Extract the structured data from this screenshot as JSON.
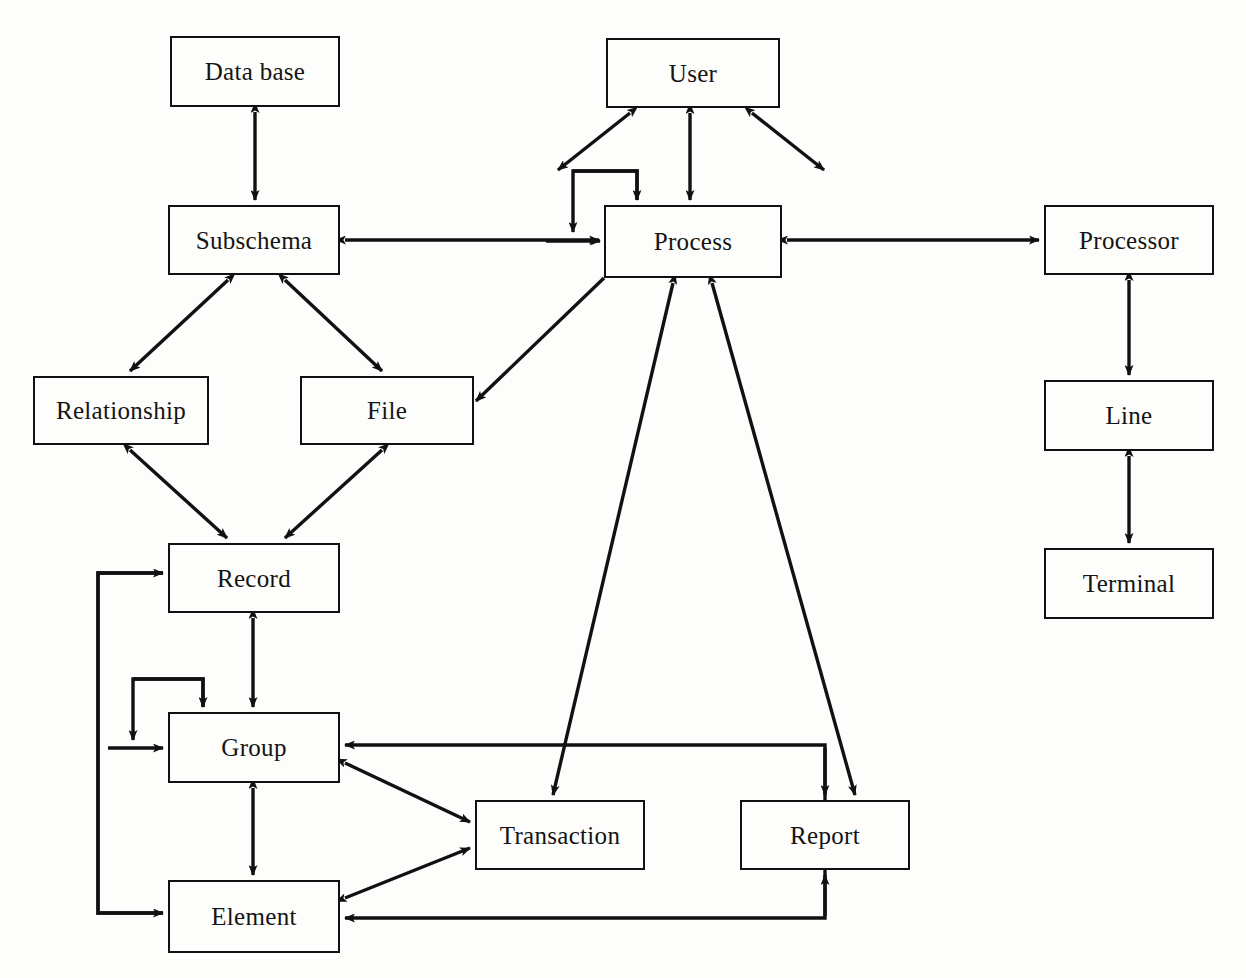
{
  "diagram": {
    "background_color": "#fdfdfc",
    "line_color": "#111111",
    "box_border_color": "#111111",
    "nodes": [
      {
        "id": "database",
        "label": "Data base",
        "x": 170,
        "y": 36,
        "w": 170,
        "h": 71
      },
      {
        "id": "user",
        "label": "User",
        "x": 606,
        "y": 38,
        "w": 174,
        "h": 70
      },
      {
        "id": "subschema",
        "label": "Subschema",
        "x": 168,
        "y": 205,
        "w": 172,
        "h": 70
      },
      {
        "id": "process",
        "label": "Process",
        "x": 604,
        "y": 205,
        "w": 178,
        "h": 73
      },
      {
        "id": "processor",
        "label": "Processor",
        "x": 1044,
        "y": 205,
        "w": 170,
        "h": 70
      },
      {
        "id": "relationship",
        "label": "Relationship",
        "x": 33,
        "y": 376,
        "w": 176,
        "h": 69
      },
      {
        "id": "file",
        "label": "File",
        "x": 300,
        "y": 376,
        "w": 174,
        "h": 69
      },
      {
        "id": "line",
        "label": "Line",
        "x": 1044,
        "y": 380,
        "w": 170,
        "h": 71
      },
      {
        "id": "record",
        "label": "Record",
        "x": 168,
        "y": 543,
        "w": 172,
        "h": 70
      },
      {
        "id": "terminal",
        "label": "Terminal",
        "x": 1044,
        "y": 548,
        "w": 170,
        "h": 71
      },
      {
        "id": "group",
        "label": "Group",
        "x": 168,
        "y": 712,
        "w": 172,
        "h": 71
      },
      {
        "id": "transaction",
        "label": "Transaction",
        "x": 475,
        "y": 800,
        "w": 170,
        "h": 70
      },
      {
        "id": "report",
        "label": "Report",
        "x": 740,
        "y": 800,
        "w": 170,
        "h": 70
      },
      {
        "id": "element",
        "label": "Element",
        "x": 168,
        "y": 880,
        "w": 172,
        "h": 73
      }
    ],
    "edges": [
      {
        "id": "database-subschema",
        "from": "database",
        "to": "subschema",
        "style": "vertical",
        "arrows": "both"
      },
      {
        "id": "user-process",
        "from": "user",
        "to": "process",
        "style": "vertical",
        "arrows": "both"
      },
      {
        "id": "user-left-stub",
        "from": "user",
        "to": "",
        "style": "diagonal",
        "arrows": "both"
      },
      {
        "id": "user-right-stub",
        "from": "user",
        "to": "",
        "style": "diagonal",
        "arrows": "both"
      },
      {
        "id": "process-self-loop",
        "from": "process",
        "to": "process",
        "style": "self-loop",
        "arrows": "both"
      },
      {
        "id": "subschema-process",
        "from": "subschema",
        "to": "process",
        "style": "horizontal",
        "arrows": "both"
      },
      {
        "id": "process-processor",
        "from": "process",
        "to": "processor",
        "style": "horizontal",
        "arrows": "both"
      },
      {
        "id": "processor-line",
        "from": "processor",
        "to": "line",
        "style": "vertical",
        "arrows": "both"
      },
      {
        "id": "line-terminal",
        "from": "line",
        "to": "terminal",
        "style": "vertical",
        "arrows": "both"
      },
      {
        "id": "subschema-relationship",
        "from": "subschema",
        "to": "relationship",
        "style": "diagonal",
        "arrows": "both"
      },
      {
        "id": "subschema-file",
        "from": "subschema",
        "to": "file",
        "style": "diagonal",
        "arrows": "both"
      },
      {
        "id": "relationship-record",
        "from": "relationship",
        "to": "record",
        "style": "diagonal",
        "arrows": "both"
      },
      {
        "id": "file-record",
        "from": "file",
        "to": "record",
        "style": "diagonal",
        "arrows": "both"
      },
      {
        "id": "process-file",
        "from": "process",
        "to": "file",
        "style": "diagonal",
        "arrows": "end"
      },
      {
        "id": "record-group",
        "from": "record",
        "to": "group",
        "style": "vertical",
        "arrows": "both"
      },
      {
        "id": "group-self-loop",
        "from": "group",
        "to": "group",
        "style": "self-loop",
        "arrows": "both"
      },
      {
        "id": "group-element",
        "from": "group",
        "to": "element",
        "style": "vertical",
        "arrows": "both"
      },
      {
        "id": "record-element-bracket",
        "from": "record",
        "to": "element",
        "style": "orthogonal",
        "arrows": "both"
      },
      {
        "id": "process-transaction",
        "from": "process",
        "to": "transaction",
        "style": "diagonal",
        "arrows": "both"
      },
      {
        "id": "process-report",
        "from": "process",
        "to": "report",
        "style": "diagonal",
        "arrows": "both"
      },
      {
        "id": "group-transaction",
        "from": "group",
        "to": "transaction",
        "style": "diagonal",
        "arrows": "both"
      },
      {
        "id": "element-transaction",
        "from": "element",
        "to": "transaction",
        "style": "diagonal",
        "arrows": "both"
      },
      {
        "id": "report-group",
        "from": "report",
        "to": "group",
        "style": "orthogonal",
        "arrows": "end"
      },
      {
        "id": "report-element",
        "from": "report",
        "to": "element",
        "style": "orthogonal",
        "arrows": "end"
      }
    ]
  }
}
